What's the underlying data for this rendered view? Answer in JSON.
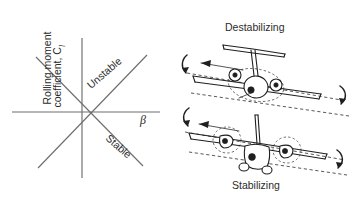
{
  "figure": {
    "background_color": "#ffffff",
    "line_color": "#6e6e6e",
    "ink_color": "#1f1f1f"
  },
  "left_panel": {
    "name": "dihedral-effect-plot",
    "y_axis_label_line1": "Rolling moment",
    "y_axis_label_line2": "coefficient, C",
    "y_axis_label_subscript": "l",
    "x_axis_label": "β",
    "diagonal_labels": [
      {
        "text": "Unstable",
        "slope": "positive",
        "angle_deg": -38
      },
      {
        "text": "Stable",
        "slope": "negative",
        "angle_deg": 38
      }
    ],
    "origin": {
      "x": 82,
      "y": 112
    },
    "axes": {
      "x_from": 12,
      "x_to": 160,
      "y_from": 38,
      "y_to": 178
    }
  },
  "right_panel": {
    "name": "aircraft-rolling-moment-illustration",
    "cases": [
      {
        "label": "Destabilizing",
        "aircraft_type": "low-wing t-tail jet",
        "roll_arrow_left": "curved-roll-arrow",
        "roll_arrow_right": "curved-roll-arrow",
        "sideslip_arrow": "left-pointing-arrow"
      },
      {
        "label": "Stabilizing",
        "aircraft_type": "high-wing twin turboprop",
        "roll_arrow_left": "curved-roll-arrow",
        "roll_arrow_right": "curved-roll-arrow",
        "sideslip_arrow": "left-pointing-arrow"
      }
    ]
  }
}
